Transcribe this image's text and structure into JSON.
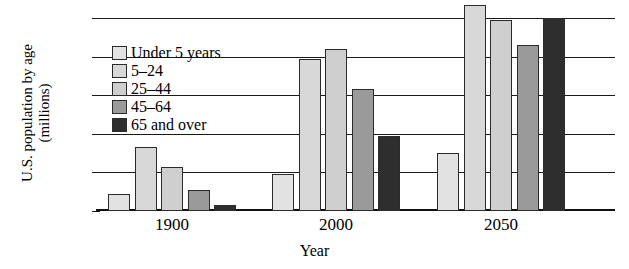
{
  "chart_data": {
    "type": "bar",
    "title": "",
    "xlabel": "Year",
    "ylabel": "U.S. population by age (millions)",
    "ylabel_line1": "U.S. population by age",
    "ylabel_line2": "(millions)",
    "categories": [
      "1900",
      "2000",
      "2050"
    ],
    "ylim": [
      0,
      100
    ],
    "yticks": [
      "0",
      "20",
      "40",
      "60",
      "80",
      "100"
    ],
    "ytick_values": [
      0,
      20,
      40,
      60,
      80,
      100
    ],
    "grid": true,
    "legend_position": "inside upper-left",
    "series": [
      {
        "name": "Under 5 years",
        "color": "#e2e2e2",
        "values": [
          9,
          19,
          30
        ]
      },
      {
        "name": "5–24",
        "color": "#d8d8d8",
        "values": [
          33,
          79,
          107
        ]
      },
      {
        "name": "25–44",
        "color": "#cfcfcf",
        "values": [
          23,
          84,
          99
        ]
      },
      {
        "name": "45–64",
        "color": "#9a9a9a",
        "values": [
          11,
          63,
          86
        ]
      },
      {
        "name": "65 and over",
        "color": "#2e2e2e",
        "values": [
          3,
          39,
          100
        ]
      }
    ]
  }
}
